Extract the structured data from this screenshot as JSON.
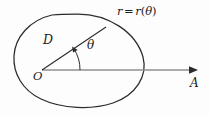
{
  "figure": {
    "background_color": "#fdfdfd",
    "stroke_color": "#2b2b2b",
    "axis_color": "#8a8a8a",
    "labels": {
      "curve_equation": {
        "text": "r = r(θ)",
        "r_symbol": "r",
        "equals": "=",
        "r_function": "r",
        "open_paren": "(",
        "theta_symbol": "θ",
        "close_paren": ")"
      },
      "radius_segment": "D",
      "angle": "θ",
      "origin": "O",
      "axis_endpoint": "A"
    },
    "geometry": {
      "origin": {
        "x": 42,
        "y": 70
      },
      "axis_arrow_tip": {
        "x": 197,
        "y": 70
      },
      "radius_endpoint": {
        "x": 106,
        "y": 27
      },
      "angle_degrees": 34,
      "curve_type": "closed oval / egg shape",
      "curve_bounds": {
        "left": 13,
        "right": 144,
        "top": 14,
        "bottom": 107
      }
    }
  }
}
